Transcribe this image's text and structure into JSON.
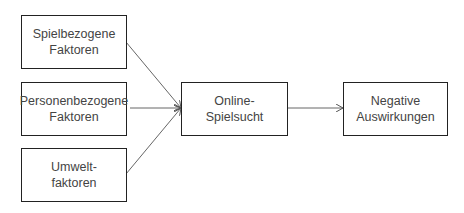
{
  "diagram": {
    "nodes": [
      {
        "id": "spielbezogene",
        "label": "Spielbezogene\nFaktoren"
      },
      {
        "id": "personenbezogene",
        "label": "Personenbezogene\nFaktoren"
      },
      {
        "id": "umwelt",
        "label": "Umwelt-\nfaktoren"
      },
      {
        "id": "online",
        "label": "Online-\nSpielsucht"
      },
      {
        "id": "negative",
        "label": "Negative\nAuswirkungen"
      }
    ],
    "edges": [
      {
        "from": "spielbezogene",
        "to": "online"
      },
      {
        "from": "personenbezogene",
        "to": "online"
      },
      {
        "from": "umwelt",
        "to": "online"
      },
      {
        "from": "online",
        "to": "negative"
      }
    ]
  }
}
